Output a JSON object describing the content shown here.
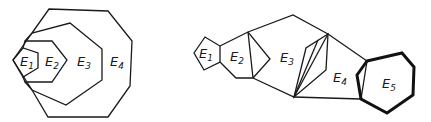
{
  "left_diagram": {
    "description": "Nested polygons",
    "labels": [
      {
        "base": "E",
        "sub": "1",
        "x": 20,
        "y": 66
      },
      {
        "base": "E",
        "sub": "2",
        "x": 45,
        "y": 66
      },
      {
        "base": "E",
        "sub": "3",
        "x": 77,
        "y": 66
      },
      {
        "base": "E",
        "sub": "4",
        "x": 110,
        "y": 66
      }
    ]
  },
  "right_diagram": {
    "description": "Chain of adjacent polygons",
    "labels": [
      {
        "base": "E",
        "sub": "1",
        "x": 199,
        "y": 58
      },
      {
        "base": "E",
        "sub": "2",
        "x": 230,
        "y": 61
      },
      {
        "base": "E",
        "sub": "3",
        "x": 280,
        "y": 62
      },
      {
        "base": "E",
        "sub": "4",
        "x": 333,
        "y": 82
      },
      {
        "base": "E",
        "sub": "5",
        "x": 382,
        "y": 88
      }
    ]
  },
  "text": {
    "e1_left": "E",
    "e1_left_sub": "1",
    "e2_left": "E",
    "e2_left_sub": "2",
    "e3_left": "E",
    "e3_left_sub": "3",
    "e4_left": "E",
    "e4_left_sub": "4",
    "e1_right": "E",
    "e1_right_sub": "1",
    "e2_right": "E",
    "e2_right_sub": "2",
    "e3_right": "E",
    "e3_right_sub": "3",
    "e4_right": "E",
    "e4_right_sub": "4",
    "e5_right": "E",
    "e5_right_sub": "5"
  }
}
